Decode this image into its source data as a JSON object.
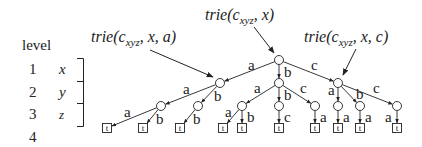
{
  "legend": {
    "header": "level",
    "rows": [
      {
        "level": "1",
        "var": "x"
      },
      {
        "level": "2",
        "var": "y"
      },
      {
        "level": "3",
        "var": "z"
      },
      {
        "level": "4",
        "var": ""
      }
    ]
  },
  "annotations": [
    {
      "id": "root",
      "prefix": "trie(c",
      "sub": "xyz",
      "suffix": ", x)"
    },
    {
      "id": "a",
      "prefix": "trie(c",
      "sub": "xyz",
      "suffix": ", x, a)"
    },
    {
      "id": "c",
      "prefix": "trie(c",
      "sub": "xyz",
      "suffix": ", x, c)"
    }
  ],
  "leaf_label": "t",
  "tree": {
    "nodes": [
      {
        "id": "r",
        "x": 279,
        "y": 60
      },
      {
        "id": "A",
        "x": 220,
        "y": 83
      },
      {
        "id": "B",
        "x": 279,
        "y": 83
      },
      {
        "id": "C",
        "x": 338,
        "y": 83
      },
      {
        "id": "Aa",
        "x": 161,
        "y": 106
      },
      {
        "id": "Ab",
        "x": 198,
        "y": 106
      },
      {
        "id": "Ba",
        "x": 242,
        "y": 106
      },
      {
        "id": "Bb",
        "x": 279,
        "y": 106
      },
      {
        "id": "Bc",
        "x": 315,
        "y": 106
      },
      {
        "id": "Ca",
        "x": 338,
        "y": 106
      },
      {
        "id": "Cb",
        "x": 360,
        "y": 106
      },
      {
        "id": "Cc",
        "x": 397,
        "y": 106
      }
    ],
    "leaves": [
      {
        "id": "Aaa",
        "x": 107,
        "y": 128
      },
      {
        "id": "Aab",
        "x": 143,
        "y": 128
      },
      {
        "id": "Abb",
        "x": 180,
        "y": 128
      },
      {
        "id": "Baa",
        "x": 223,
        "y": 128
      },
      {
        "id": "Bab",
        "x": 242,
        "y": 128
      },
      {
        "id": "Bbc",
        "x": 279,
        "y": 128
      },
      {
        "id": "Bca",
        "x": 315,
        "y": 128
      },
      {
        "id": "Caa",
        "x": 338,
        "y": 128
      },
      {
        "id": "Cba",
        "x": 360,
        "y": 128
      },
      {
        "id": "Cca",
        "x": 397,
        "y": 128
      }
    ],
    "edges": [
      {
        "from": "r",
        "to": "A",
        "label": "a",
        "lx": 248,
        "ly": 70
      },
      {
        "from": "r",
        "to": "B",
        "label": "b",
        "lx": 284,
        "ly": 77
      },
      {
        "from": "r",
        "to": "C",
        "label": "c",
        "lx": 311,
        "ly": 70
      },
      {
        "from": "A",
        "to": "Aa",
        "label": "a",
        "lx": 183,
        "ly": 94
      },
      {
        "from": "A",
        "to": "Ab",
        "label": "b",
        "lx": 214,
        "ly": 101
      },
      {
        "from": "B",
        "to": "Ba",
        "label": "a",
        "lx": 254,
        "ly": 93
      },
      {
        "from": "B",
        "to": "Bb",
        "label": "b",
        "lx": 284,
        "ly": 100
      },
      {
        "from": "B",
        "to": "Bc",
        "label": "c",
        "lx": 300,
        "ly": 93
      },
      {
        "from": "C",
        "to": "Ca",
        "label": "a",
        "lx": 328,
        "ly": 95
      },
      {
        "from": "C",
        "to": "Cb",
        "label": "b",
        "lx": 356,
        "ly": 99
      },
      {
        "from": "C",
        "to": "Cc",
        "label": "c",
        "lx": 373,
        "ly": 93
      },
      {
        "from": "Aa",
        "to": "Aaa",
        "label": "a",
        "lx": 124,
        "ly": 117
      },
      {
        "from": "Aa",
        "to": "Aab",
        "label": "b",
        "lx": 156,
        "ly": 124
      },
      {
        "from": "Ab",
        "to": "Abb",
        "label": "b",
        "lx": 193,
        "ly": 124
      },
      {
        "from": "Ba",
        "to": "Baa",
        "label": "a",
        "lx": 225,
        "ly": 117
      },
      {
        "from": "Ba",
        "to": "Bab",
        "label": "b",
        "lx": 247,
        "ly": 122
      },
      {
        "from": "Bb",
        "to": "Bbc",
        "label": "c",
        "lx": 284,
        "ly": 122
      },
      {
        "from": "Bc",
        "to": "Bca",
        "label": "a",
        "lx": 320,
        "ly": 122
      },
      {
        "from": "Ca",
        "to": "Caa",
        "label": "a",
        "lx": 343,
        "ly": 122
      },
      {
        "from": "Cb",
        "to": "Cba",
        "label": "a",
        "lx": 365,
        "ly": 122
      },
      {
        "from": "Cc",
        "to": "Cca",
        "label": "a",
        "lx": 385,
        "ly": 122
      }
    ]
  },
  "colors": {
    "ink": "#222222",
    "background": "#ffffff"
  }
}
